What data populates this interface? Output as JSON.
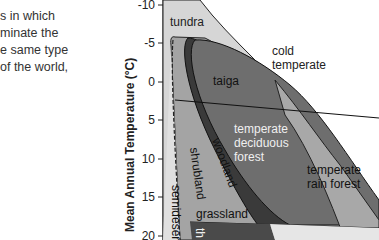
{
  "document_text": {
    "lines": [
      "s in which",
      "minate the",
      "e same type",
      " of the world,"
    ]
  },
  "diagram": {
    "type": "biome diagram",
    "y_axis": {
      "label": "Mean Annual Temperature (°C)",
      "ticks": [
        "-10",
        "-5",
        "0",
        "5",
        "10",
        "15",
        "20"
      ]
    },
    "biomes": {
      "tundra": "tundra",
      "cold_temperate": [
        "cold",
        "temperate"
      ],
      "taiga": "taiga",
      "temperate_deciduous_forest": [
        "temperate",
        "deciduous",
        "forest"
      ],
      "woodland": "woodland",
      "shrubland": "shrubland",
      "temperate_rain_forest": [
        "temperate",
        "rain forest"
      ],
      "grassland": "grassland",
      "semidesert": "semidesert",
      "partial_label": "th"
    },
    "colors": {
      "light": "#d9d9d9",
      "mid": "#a8a8a8",
      "dark": "#6b6b6b",
      "darker": "#3c3c3c",
      "lightest": "#e8e8e8"
    }
  }
}
